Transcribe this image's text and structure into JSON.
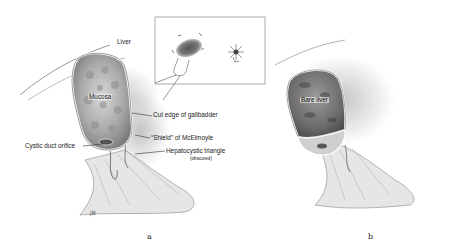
{
  "figure": {
    "panels": [
      {
        "id": "a",
        "caption": "a",
        "labels": {
          "liver": "Liver",
          "mucosa": "Mucosa",
          "cut_edge": "Cut edge of gallbadder",
          "shield": "“Shield” of McElmoyle",
          "cystic_duct": "Cystic duct orifice",
          "hepatocystic": "Hepatocystic triangle",
          "obscured": "(obscured)"
        },
        "signature": "JB"
      },
      {
        "id": "b",
        "caption": "b",
        "labels": {
          "bare_liver": "Bare liver"
        }
      }
    ],
    "inset": {
      "description": "inset box with gallbladder detail and star-shaped stump"
    }
  }
}
